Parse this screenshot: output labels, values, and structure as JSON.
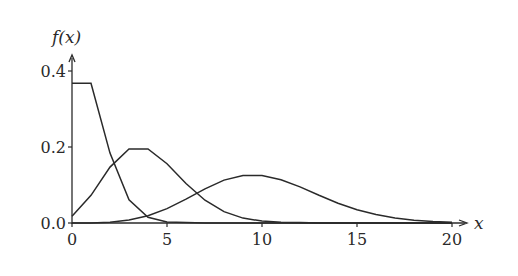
{
  "chart_data": {
    "type": "line",
    "title": "",
    "xlabel": "x",
    "ylabel": "f(x)",
    "xlim": [
      0,
      20
    ],
    "ylim": [
      0,
      0.4
    ],
    "grid": false,
    "legend": "none",
    "x_ticks": [
      "0",
      "5",
      "10",
      "15",
      "20"
    ],
    "y_ticks": [
      "0.0",
      "0.2",
      "0.4"
    ],
    "x": [
      0,
      1,
      2,
      3,
      4,
      5,
      6,
      7,
      8,
      9,
      10,
      11,
      12,
      13,
      14,
      15,
      16,
      17,
      18,
      19,
      20
    ],
    "series": [
      {
        "name": "Poisson λ=1",
        "values": [
          0.368,
          0.368,
          0.184,
          0.061,
          0.015,
          0.003,
          0.001,
          0,
          0,
          0,
          0,
          0,
          0,
          0,
          0,
          0,
          0,
          0,
          0,
          0,
          0
        ]
      },
      {
        "name": "Poisson λ=4",
        "values": [
          0.018,
          0.073,
          0.147,
          0.195,
          0.195,
          0.156,
          0.104,
          0.06,
          0.03,
          0.013,
          0.005,
          0.002,
          0.001,
          0,
          0,
          0,
          0,
          0,
          0,
          0,
          0
        ]
      },
      {
        "name": "Poisson λ=10",
        "values": [
          0.0,
          0.0,
          0.002,
          0.008,
          0.019,
          0.038,
          0.063,
          0.09,
          0.113,
          0.125,
          0.125,
          0.114,
          0.095,
          0.073,
          0.052,
          0.035,
          0.022,
          0.013,
          0.007,
          0.004,
          0.002
        ]
      }
    ]
  },
  "axes": {
    "ylabel": "f(x)",
    "xlabel": "x"
  }
}
